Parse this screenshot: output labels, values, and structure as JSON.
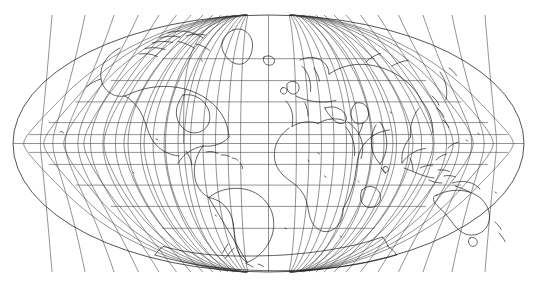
{
  "figure": {
    "projection_name": "Mollweide",
    "background_color": "#ffffff",
    "graticule_color": "#4a4a4a",
    "coastline_color": "#111111",
    "outline_color": "#2a2a2a"
  },
  "chart_data": {
    "type": "map",
    "title": "",
    "subtitle": "",
    "xlabel": "",
    "ylabel": "",
    "projection": "Mollweide (equal-area pseudocylindrical)",
    "central_meridian": 0,
    "grid": true,
    "legend": "none",
    "lon_range": [
      -180,
      180
    ],
    "lat_range": [
      -90,
      90
    ],
    "graticule": {
      "meridian_step_deg": 15,
      "parallel_step_deg": 15,
      "meridian_values": [
        -180,
        -165,
        -150,
        -135,
        -120,
        -105,
        -90,
        -75,
        -60,
        -45,
        -30,
        -15,
        0,
        15,
        30,
        45,
        60,
        75,
        90,
        105,
        120,
        135,
        150,
        165,
        180
      ],
      "parallel_values": [
        -75,
        -60,
        -45,
        -30,
        -15,
        0,
        15,
        30,
        45,
        60,
        75
      ]
    },
    "ellipse_pixel_bounds": {
      "left": 13,
      "right": 524,
      "top": 15,
      "bottom": 272,
      "center_x": 268.5,
      "center_y": 143.5,
      "semi_axis_x": 255.5,
      "semi_axis_y": 128.5
    },
    "features": [
      "North America",
      "Greenland",
      "Canadian Arctic Archipelago",
      "South America",
      "Europe",
      "Africa",
      "Madagascar",
      "Asia",
      "Arabian Peninsula",
      "India",
      "Southeast Asia",
      "Indonesia",
      "New Guinea",
      "Australia",
      "New Zealand",
      "Japan",
      "British Isles",
      "Antarctica",
      "Iceland",
      "Caribbean islands"
    ],
    "axis_tick_labels": [],
    "annotations": []
  }
}
